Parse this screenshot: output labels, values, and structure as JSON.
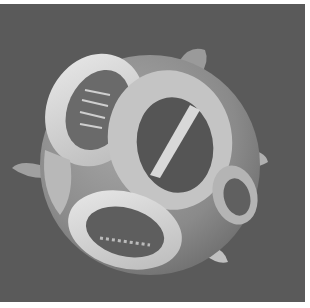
{
  "image": {
    "subject": "scanning electron micrograph of a coccosphere (coccolithophore)",
    "description": "Grayscale SEM image of a spherical cell covered in overlapping oval coccolith plates with slotted central areas and protruding spines",
    "colors": {
      "background": "#5a5a5a",
      "page": "#ffffff",
      "sphere_body": "#8e8e8e",
      "plate_rim": "#d8d8d8",
      "plate_center": "#5e5e5e",
      "highlight": "#eeeeee"
    }
  }
}
